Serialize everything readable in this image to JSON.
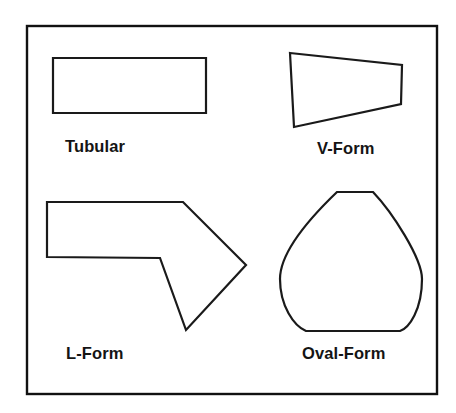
{
  "figure": {
    "background_color": "#ffffff",
    "stroke_color": "#1a1a1a",
    "frame": {
      "name": "outer-border",
      "x": 27,
      "y": 26,
      "width": 410,
      "height": 368,
      "stroke_color": "#111111",
      "stroke_width": 2.4
    },
    "shapes": [
      {
        "id": "tubular",
        "label": "Tubular",
        "type": "rectangle",
        "description": "Long horizontal rectangle",
        "points": "53,58 206,58 206,113 53,113",
        "label_position": {
          "x": 65,
          "y": 137
        }
      },
      {
        "id": "v-form",
        "label": "V-Form",
        "type": "quadrilateral",
        "description": "Tapered quadrilateral, wide at left and narrow at right",
        "points": "290,53 402,65 401,104 294,127",
        "label_position": {
          "x": 317,
          "y": 139
        }
      },
      {
        "id": "l-form",
        "label": "L-Form",
        "type": "polygon",
        "description": "Arrow-like bent L polygon pointing right",
        "points": "47,202 183,202 246,265 186,330 160,258 47,257",
        "label_position": {
          "x": 66,
          "y": 344
        }
      },
      {
        "id": "oval-form",
        "label": "Oval-Form",
        "type": "closed-curve",
        "description": "Pear or egg shaped rounded form with flat top and flat bottom",
        "path": "M 337,192 L 373,192 C 392,212 422,258 422,279 C 422,310 409,328 400,331 L 306,331 C 294,326 280,306 280,279 C 280,250 313,215 337,192 Z",
        "label_position": {
          "x": 302,
          "y": 344
        }
      }
    ]
  }
}
